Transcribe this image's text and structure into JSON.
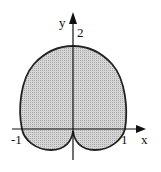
{
  "figure": {
    "type": "polar-region",
    "axes": {
      "x_label": "x",
      "y_label": "y",
      "x_ticks": [
        "-1",
        "1"
      ],
      "y_ticks": [
        "2"
      ]
    },
    "colors": {
      "fill": "#c9c9c9",
      "stroke": "#222222"
    }
  }
}
